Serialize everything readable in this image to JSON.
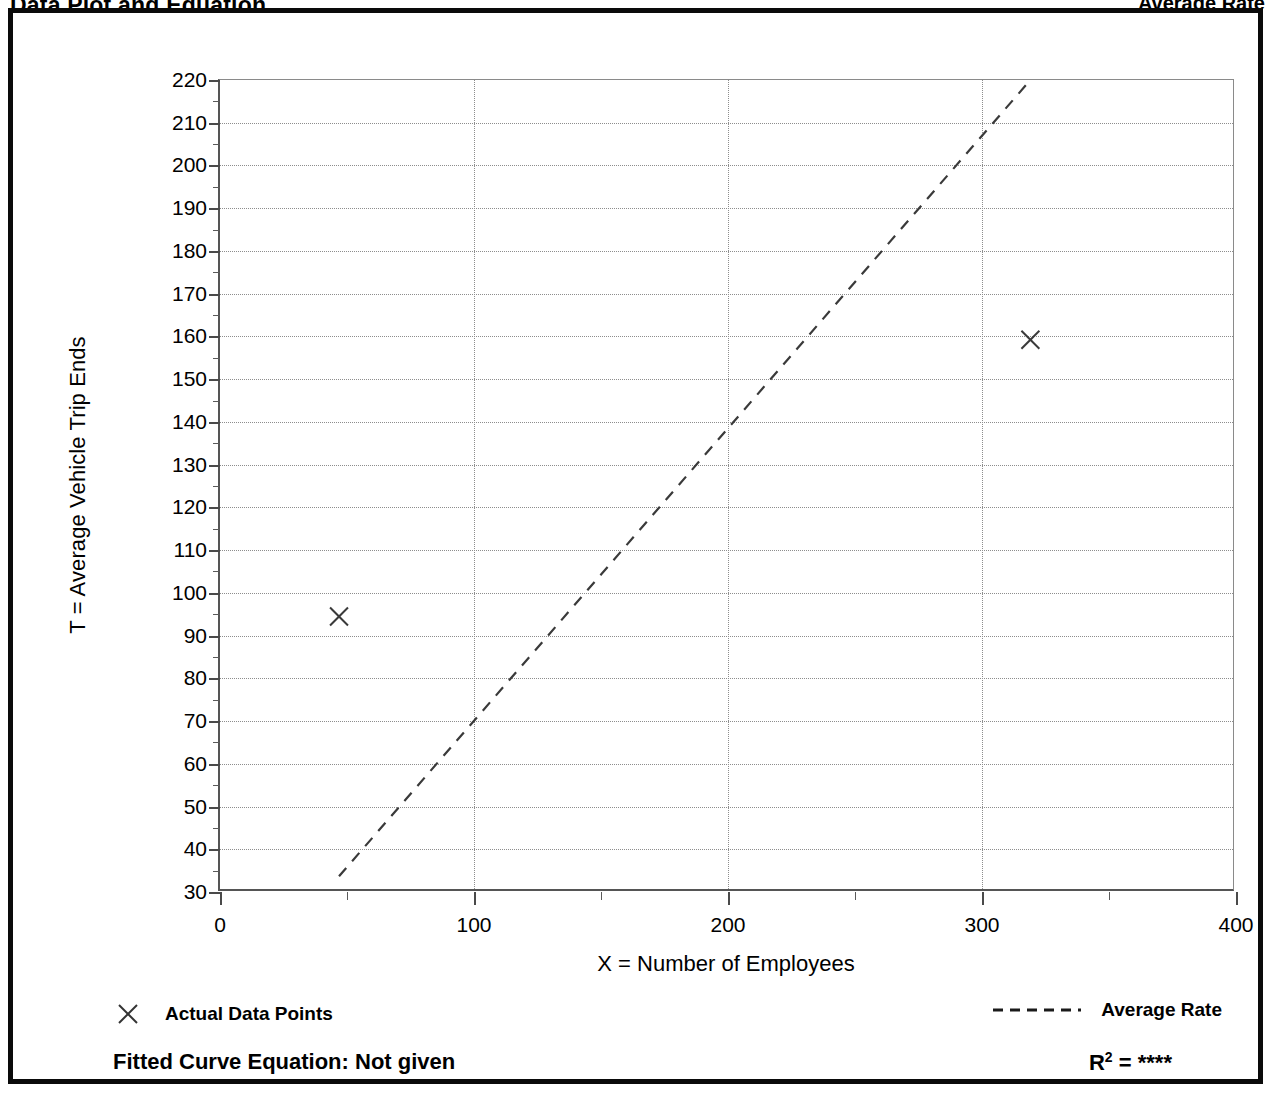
{
  "page_header": {
    "left_title": "Data Plot and Equation",
    "right_title": "Average Rate"
  },
  "chart_data": {
    "type": "scatter",
    "title": "Data Plot and Equation",
    "xlabel": "X = Number of Employees",
    "ylabel": "T = Average Vehicle Trip Ends",
    "xlim": [
      0,
      400
    ],
    "ylim": [
      30,
      220
    ],
    "xticks": [
      0,
      100,
      200,
      300,
      400
    ],
    "xtick_labels": [
      "0",
      "100",
      "200",
      "300",
      "400"
    ],
    "x_minor_ticks": [
      50,
      150,
      250,
      350
    ],
    "yticks": [
      30,
      40,
      50,
      60,
      70,
      80,
      90,
      100,
      110,
      120,
      130,
      140,
      150,
      160,
      170,
      180,
      190,
      200,
      210,
      220
    ],
    "ytick_labels": [
      "30",
      "40",
      "50",
      "60",
      "70",
      "80",
      "90",
      "100",
      "110",
      "120",
      "130",
      "140",
      "150",
      "160",
      "170",
      "180",
      "190",
      "200",
      "210",
      "220"
    ],
    "y_minor_ticks": [
      35,
      45,
      55,
      65,
      75,
      85,
      95,
      105,
      115,
      125,
      135,
      145,
      155,
      165,
      175,
      185,
      195,
      205,
      215
    ],
    "grid": true,
    "grid_style": "dotted",
    "grid_x": [
      100,
      200,
      300
    ],
    "legend_position": "below-plot",
    "series": [
      {
        "name": "Actual Data Points",
        "type": "scatter",
        "marker": "x",
        "color": "#3a3a3a",
        "points": [
          {
            "x": 47,
            "y": 94
          },
          {
            "x": 320,
            "y": 159
          }
        ]
      },
      {
        "name": "Average Rate",
        "type": "line",
        "style": "dashed",
        "color": "#3a3a3a",
        "points": [
          {
            "x": 47,
            "y": 33
          },
          {
            "x": 320,
            "y": 220
          }
        ]
      }
    ]
  },
  "legend": {
    "actual_data_points": "Actual Data Points",
    "average_rate": "Average Rate"
  },
  "footer": {
    "fitted_equation": "Fitted Curve Equation:  Not given",
    "r_squared_label": "R",
    "r_squared_exponent": "2",
    "r_squared_value": "= ****"
  }
}
